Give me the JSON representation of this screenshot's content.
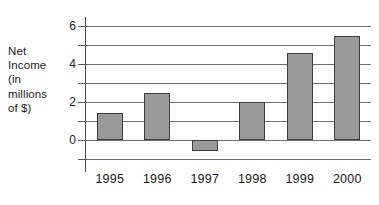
{
  "chart_data": {
    "type": "bar",
    "title": "",
    "xlabel": "",
    "ylabel": "Net Income (in millions of $)",
    "ylabel_lines": [
      "Net",
      "Income",
      "(in",
      "millions",
      "of $)"
    ],
    "categories": [
      "1995",
      "1996",
      "1997",
      "1998",
      "1999",
      "2000"
    ],
    "values": [
      1.4,
      2.5,
      -0.6,
      2.0,
      4.6,
      5.5
    ],
    "series": [
      {
        "name": "Net Income",
        "values": [
          1.4,
          2.5,
          -0.6,
          2.0,
          4.6,
          5.5
        ]
      }
    ],
    "ylim": [
      -1,
      6
    ],
    "ytick_labels": [
      "6",
      "4",
      "2",
      "0"
    ],
    "ytick_values": [
      6,
      4,
      2,
      0
    ],
    "yminor_values": [
      5,
      3,
      1,
      -1
    ],
    "gridline_values": [
      6,
      5,
      4,
      3,
      2,
      1,
      0,
      -1
    ],
    "grid": true,
    "legend": "none",
    "bar_color": "#9a9a9a",
    "bar_edge_color": "#3d3d3d",
    "grid_color": "#6e6e6e",
    "axis_color": "#4a4a4a",
    "background": "#ffffff"
  }
}
